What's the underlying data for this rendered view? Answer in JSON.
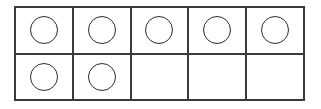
{
  "figure": {
    "name": "ten-frame",
    "rows": 2,
    "columns": 5,
    "total_cells": 10,
    "filled_count": 7,
    "empty_count": 3,
    "frame_border_color": "#3a3a3a",
    "counter_outline_color": "#2b2b2b",
    "counter_fill_color": "transparent",
    "background_color": "#ffffff"
  },
  "grid": {
    "rows": [
      {
        "label": "top-row",
        "cells": [
          {
            "index": 1,
            "filled": true,
            "counter_label": "circle"
          },
          {
            "index": 2,
            "filled": true,
            "counter_label": "circle"
          },
          {
            "index": 3,
            "filled": true,
            "counter_label": "circle"
          },
          {
            "index": 4,
            "filled": true,
            "counter_label": "circle"
          },
          {
            "index": 5,
            "filled": true,
            "counter_label": "circle"
          }
        ]
      },
      {
        "label": "bottom-row",
        "cells": [
          {
            "index": 6,
            "filled": true,
            "counter_label": "circle"
          },
          {
            "index": 7,
            "filled": true,
            "counter_label": "circle"
          },
          {
            "index": 8,
            "filled": false,
            "counter_label": ""
          },
          {
            "index": 9,
            "filled": false,
            "counter_label": ""
          },
          {
            "index": 10,
            "filled": false,
            "counter_label": ""
          }
        ]
      }
    ]
  }
}
